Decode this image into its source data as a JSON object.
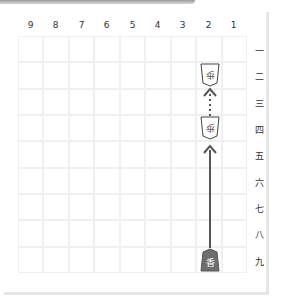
{
  "board": {
    "columns": [
      "9",
      "8",
      "7",
      "6",
      "5",
      "4",
      "3",
      "2",
      "1"
    ],
    "rows": [
      "一",
      "二",
      "三",
      "四",
      "五",
      "六",
      "七",
      "八",
      "九"
    ],
    "pieces": [
      {
        "label": "歩",
        "square": "2二",
        "owner": "gote"
      },
      {
        "label": "歩",
        "square": "2四",
        "owner": "gote"
      },
      {
        "label": "香",
        "square": "2九",
        "owner": "sente",
        "highlighted": true
      }
    ],
    "moves": [
      {
        "from": "2九",
        "to": "2四",
        "style": "solid"
      },
      {
        "from": "2四",
        "to": "2二",
        "style": "dotted"
      }
    ]
  },
  "colors": {
    "highlight_piece": "#6e6e6e",
    "arrow": "#555555",
    "grid": "#f0f0f0"
  }
}
